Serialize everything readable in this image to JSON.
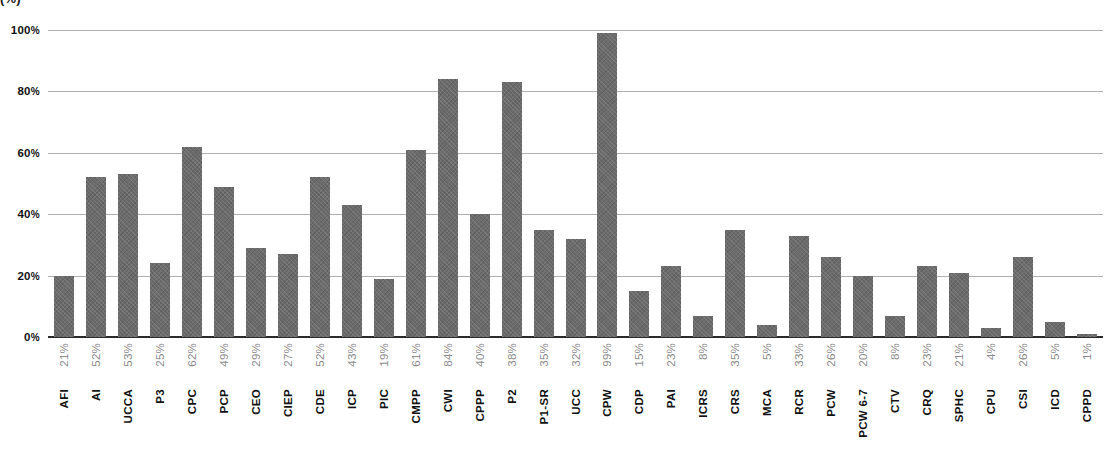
{
  "chart_data": {
    "type": "bar",
    "title": "(%)",
    "title_note": "title row is cropped off at the top edge of the screenshot; only a fragment with parentheses is visible",
    "xlabel": "",
    "ylabel": "",
    "ylim": [
      0,
      100
    ],
    "y_ticks": [
      0,
      20,
      40,
      60,
      80,
      100
    ],
    "y_tick_labels": [
      "0%",
      "20%",
      "40%",
      "60%",
      "80%",
      "100%"
    ],
    "grid": true,
    "grid_axis": "y",
    "legend": false,
    "orientation": "vertical",
    "bar_color": "#6b6b6b",
    "axis_color": "#2b2b2b",
    "gridline_color": "#b0b0b0",
    "value_label_color": "#8a8a8a",
    "category_label_color": "#111111",
    "categories": [
      "AFI",
      "AI",
      "UCCA",
      "P3",
      "CPC",
      "PCP",
      "CEO",
      "CIEP",
      "CDE",
      "ICP",
      "PIC",
      "CMPP",
      "CWI",
      "CPPP",
      "P2",
      "P1-SR",
      "UCC",
      "CPW",
      "CDP",
      "PAI",
      "ICRS",
      "CRS",
      "MCA",
      "RCR",
      "PCW",
      "PCW 6-7",
      "CTV",
      "CRQ",
      "SPHC",
      "CPU",
      "CSI",
      "ICD",
      "CPPD"
    ],
    "value_labels": [
      "21%",
      "52%",
      "53%",
      "25%",
      "62%",
      "49%",
      "29%",
      "27%",
      "52%",
      "43%",
      "19%",
      "61%",
      "84%",
      "40%",
      "38%",
      "35%",
      "32%",
      "99%",
      "15%",
      "23%",
      "8%",
      "35%",
      "5%",
      "33%",
      "26%",
      "20%",
      "8%",
      "23%",
      "21%",
      "4%",
      "26%",
      "5%",
      "1%"
    ],
    "values": [
      21,
      52,
      53,
      25,
      62,
      49,
      29,
      27,
      52,
      43,
      19,
      61,
      84,
      40,
      38,
      35,
      32,
      99,
      15,
      23,
      8,
      35,
      5,
      33,
      26,
      20,
      8,
      23,
      21,
      4,
      26,
      5,
      1
    ],
    "plotted_bar_heights": [
      20,
      52,
      53,
      24,
      62,
      49,
      29,
      27,
      52,
      43,
      19,
      61,
      84,
      40,
      83,
      35,
      32,
      99,
      15,
      23,
      7,
      35,
      4,
      33,
      26,
      20,
      7,
      23,
      21,
      3,
      26,
      5,
      1
    ]
  }
}
